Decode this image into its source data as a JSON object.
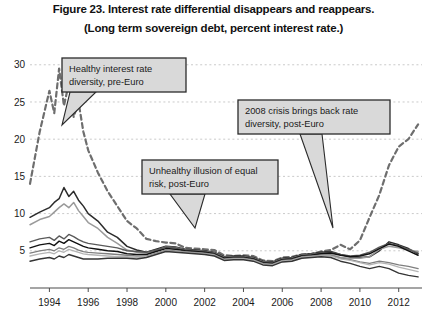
{
  "figure": {
    "title_line1": "Figure 23. Interest rate differential disappears and reappears.",
    "title_line2": "(Long term sovereign debt, percent interest rate.)"
  },
  "chart_data": {
    "type": "line",
    "title": "Figure 23. Interest rate differential disappears and reappears.",
    "subtitle": "(Long term sovereign debt, percent interest rate.)",
    "xlabel": "",
    "ylabel": "",
    "xlim": [
      1993.0,
      2013.2
    ],
    "ylim": [
      0,
      31
    ],
    "yticks": [
      5,
      10,
      15,
      20,
      25,
      30
    ],
    "xticks": [
      1994,
      1996,
      1998,
      2000,
      2002,
      2004,
      2006,
      2008,
      2010,
      2012
    ],
    "ytick_labels": [
      "5",
      "10",
      "15",
      "20",
      "25",
      "30"
    ],
    "xtick_labels": [
      "1994",
      "1996",
      "1998",
      "2000",
      "2002",
      "2004",
      "2006",
      "2008",
      "2010",
      "2012"
    ],
    "grid": "horizontal-dashed",
    "legend": "none",
    "x": [
      1993.0,
      1993.5,
      1994.0,
      1994.25,
      1994.5,
      1994.75,
      1995.0,
      1995.25,
      1995.5,
      1995.75,
      1996.0,
      1996.5,
      1997.0,
      1997.5,
      1998.0,
      1998.5,
      1999.0,
      1999.5,
      2000.0,
      2000.5,
      2001.0,
      2001.5,
      2002.0,
      2002.5,
      2003.0,
      2003.5,
      2004.0,
      2004.5,
      2005.0,
      2005.5,
      2006.0,
      2006.5,
      2007.0,
      2007.5,
      2008.0,
      2008.5,
      2009.0,
      2009.5,
      2010.0,
      2010.5,
      2011.0,
      2011.5,
      2012.0,
      2012.5,
      2013.0
    ],
    "series": [
      {
        "name": "greece",
        "style": "dashed",
        "color": "#6e6e6e",
        "width": 2.2,
        "values": [
          14.0,
          21.0,
          26.5,
          23.5,
          29.5,
          24.5,
          27.5,
          23.0,
          25.0,
          21.0,
          18.5,
          15.5,
          13.0,
          11.0,
          9.0,
          8.0,
          6.6,
          6.3,
          6.1,
          6.0,
          5.4,
          5.3,
          5.2,
          5.1,
          4.4,
          4.3,
          4.4,
          4.3,
          3.7,
          3.6,
          4.1,
          4.2,
          4.5,
          4.6,
          4.9,
          5.1,
          5.8,
          5.2,
          6.4,
          9.5,
          12.5,
          16.5,
          19.0,
          20.0,
          22.0
        ]
      },
      {
        "name": "italy-dark",
        "style": "solid",
        "color": "#2b2b2b",
        "width": 1.5,
        "values": [
          9.5,
          10.2,
          10.8,
          11.5,
          12.0,
          13.5,
          12.3,
          13.0,
          11.8,
          11.0,
          10.0,
          9.0,
          7.5,
          6.8,
          5.6,
          5.1,
          4.8,
          5.2,
          5.6,
          5.5,
          5.2,
          5.1,
          5.0,
          4.8,
          4.2,
          4.3,
          4.3,
          4.1,
          3.6,
          3.5,
          4.0,
          4.1,
          4.5,
          4.6,
          4.8,
          4.9,
          4.5,
          4.2,
          4.1,
          4.2,
          5.0,
          6.2,
          5.8,
          5.3,
          4.6
        ]
      },
      {
        "name": "spain-mid",
        "style": "solid",
        "color": "#9a9a9a",
        "width": 1.5,
        "values": [
          8.5,
          9.2,
          9.6,
          10.2,
          10.8,
          11.3,
          10.8,
          11.5,
          10.4,
          9.6,
          8.8,
          8.0,
          6.8,
          6.0,
          5.1,
          4.8,
          4.7,
          5.0,
          5.5,
          5.4,
          5.1,
          5.0,
          4.9,
          4.7,
          4.1,
          4.2,
          4.2,
          4.0,
          3.5,
          3.4,
          3.9,
          4.0,
          4.4,
          4.5,
          4.6,
          4.5,
          4.1,
          4.0,
          4.0,
          4.2,
          5.2,
          5.6,
          5.4,
          5.1,
          4.9
        ]
      },
      {
        "name": "portugal",
        "style": "solid",
        "color": "#5a5a5a",
        "width": 1.4,
        "values": [
          6.2,
          6.6,
          6.8,
          6.4,
          7.0,
          6.6,
          7.2,
          6.9,
          6.5,
          6.2,
          6.0,
          5.8,
          5.6,
          5.4,
          5.0,
          4.9,
          4.8,
          5.1,
          5.5,
          5.4,
          5.1,
          5.0,
          4.9,
          4.7,
          4.1,
          4.2,
          4.2,
          4.0,
          3.5,
          3.4,
          3.9,
          4.0,
          4.4,
          4.5,
          4.7,
          4.8,
          4.5,
          4.3,
          4.4,
          4.8,
          5.5,
          6.0,
          5.7,
          5.2,
          4.7
        ]
      },
      {
        "name": "ireland",
        "style": "solid",
        "color": "#111111",
        "width": 1.4,
        "values": [
          5.4,
          5.8,
          6.0,
          5.7,
          6.3,
          6.0,
          6.5,
          6.2,
          5.9,
          5.6,
          5.4,
          5.2,
          5.0,
          4.9,
          4.6,
          4.5,
          4.5,
          4.9,
          5.3,
          5.2,
          5.0,
          4.9,
          4.8,
          4.6,
          4.0,
          4.1,
          4.1,
          3.9,
          3.4,
          3.3,
          3.8,
          3.9,
          4.3,
          4.4,
          4.6,
          4.7,
          4.4,
          4.2,
          4.3,
          4.6,
          5.3,
          5.9,
          5.6,
          5.0,
          4.4
        ]
      },
      {
        "name": "france",
        "style": "solid",
        "color": "#7f7f7f",
        "width": 1.3,
        "values": [
          4.7,
          5.0,
          5.2,
          5.0,
          5.4,
          5.2,
          5.6,
          5.4,
          5.1,
          4.9,
          4.8,
          4.7,
          4.6,
          4.5,
          4.4,
          4.3,
          4.3,
          4.7,
          5.1,
          5.0,
          4.9,
          4.8,
          4.7,
          4.5,
          3.9,
          4.0,
          4.0,
          3.8,
          3.3,
          3.2,
          3.7,
          3.8,
          4.2,
          4.3,
          4.4,
          4.4,
          4.0,
          3.8,
          3.5,
          3.3,
          3.6,
          3.4,
          3.1,
          2.9,
          2.6
        ]
      },
      {
        "name": "netherlands",
        "style": "solid",
        "color": "#b4b4b4",
        "width": 1.3,
        "values": [
          4.3,
          4.6,
          4.8,
          4.6,
          5.0,
          4.8,
          5.2,
          5.0,
          4.8,
          4.6,
          4.5,
          4.4,
          4.3,
          4.2,
          4.2,
          4.1,
          4.2,
          4.6,
          5.0,
          4.9,
          4.8,
          4.7,
          4.6,
          4.4,
          3.8,
          3.9,
          3.9,
          3.7,
          3.2,
          3.1,
          3.6,
          3.7,
          4.1,
          4.2,
          4.3,
          4.3,
          3.9,
          3.7,
          3.4,
          3.1,
          3.4,
          3.2,
          2.8,
          2.5,
          2.2
        ]
      },
      {
        "name": "germany",
        "style": "solid",
        "color": "#353535",
        "width": 1.4,
        "values": [
          3.6,
          3.9,
          4.1,
          3.9,
          4.3,
          4.1,
          4.5,
          4.3,
          4.1,
          3.9,
          3.9,
          3.9,
          4.0,
          4.0,
          4.0,
          3.9,
          4.1,
          4.5,
          4.9,
          4.8,
          4.7,
          4.6,
          4.5,
          4.3,
          3.7,
          3.8,
          3.8,
          3.6,
          3.1,
          3.0,
          3.5,
          3.6,
          4.0,
          4.1,
          4.2,
          4.1,
          3.6,
          3.3,
          2.9,
          2.6,
          2.9,
          2.6,
          2.0,
          1.7,
          1.5
        ]
      }
    ],
    "annotations": [
      {
        "name": "healthy-diversity",
        "lines": [
          "Healthy interest rate",
          "diversity, pre-Euro"
        ],
        "box": {
          "x": 62,
          "y": 58,
          "w": 124,
          "h": 34
        },
        "tail": [
          [
            70,
            92
          ],
          [
            96,
            92
          ],
          [
            62,
            125
          ]
        ]
      },
      {
        "name": "unhealthy-illusion",
        "lines": [
          "Unhealthy illusion of equal",
          "risk, post-Euro"
        ],
        "box": {
          "x": 142,
          "y": 160,
          "w": 136,
          "h": 34
        },
        "tail": [
          [
            170,
            194
          ],
          [
            205,
            194
          ],
          [
            195,
            228
          ]
        ]
      },
      {
        "name": "crisis-diversity",
        "lines": [
          "2008 crisis brings back rate",
          "diversity, post-Euro"
        ],
        "box": {
          "x": 238,
          "y": 100,
          "w": 152,
          "h": 34
        },
        "tail": [
          [
            300,
            134
          ],
          [
            322,
            134
          ],
          [
            333,
            228
          ]
        ]
      }
    ],
    "colors": {
      "grid": "#bdbdbd",
      "axis": "#4d4d4d",
      "callout_fill": "#d9d9d9",
      "callout_stroke": "#2b2b2b",
      "background": "#ffffff"
    }
  }
}
